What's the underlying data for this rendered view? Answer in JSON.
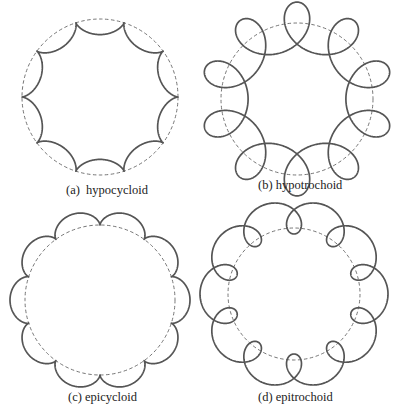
{
  "figure": {
    "curve_color": "#555555",
    "guide_color": "#666666",
    "background": "#ffffff",
    "panels": [
      {
        "id": "a",
        "caption": "(a)  hypocycloid",
        "type": "hypocycloid",
        "center": [
          100,
          97
        ],
        "base_radius": 78,
        "cusps": 10,
        "rolling_radius": 7.8,
        "pen_offset": 7.8,
        "rotation_deg": 0,
        "caption_pos": [
          66,
          184
        ]
      },
      {
        "id": "b",
        "caption": "(b) hypotrochoid",
        "type": "hypotrochoid",
        "center": [
          297,
          99
        ],
        "base_radius": 76,
        "cusps": 10,
        "rolling_radius": 8.1,
        "pen_offset": 24,
        "rotation_deg": 18,
        "caption_pos": [
          258,
          179
        ]
      },
      {
        "id": "c",
        "caption": "(c) epicycloid",
        "type": "epicycloid",
        "center": [
          100,
          300
        ],
        "base_radius": 75,
        "cusps": 10,
        "rolling_radius": 7.0,
        "pen_offset": 7.0,
        "rotation_deg": 90,
        "caption_pos": [
          68,
          391
        ]
      },
      {
        "id": "d",
        "caption": "(d) epitrochoid",
        "type": "epitrochoid",
        "center": [
          294,
          294
        ],
        "base_radius": 66,
        "cusps": 10,
        "rolling_radius": 7.0,
        "pen_offset": 17,
        "rotation_deg": 18,
        "caption_pos": [
          258,
          391
        ]
      }
    ]
  }
}
